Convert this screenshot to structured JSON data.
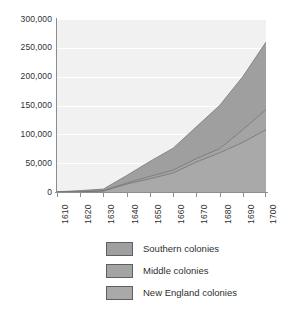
{
  "chart_data": {
    "type": "area",
    "stacked": true,
    "title": "",
    "subtitle": "",
    "xlabel": "",
    "ylabel": "",
    "grid": true,
    "legend_position": "bottom",
    "x": [
      1610,
      1620,
      1630,
      1640,
      1650,
      1660,
      1670,
      1680,
      1690,
      1700
    ],
    "xlim": [
      1610,
      1700
    ],
    "ylim": [
      0,
      300000
    ],
    "x_tick_labels": [
      "1610",
      "1620",
      "1630",
      "1640",
      "1650",
      "1660",
      "1670",
      "1680",
      "1690",
      "1700"
    ],
    "y_tick_labels": [
      "0",
      "50,000",
      "100,000",
      "150,000",
      "200,000",
      "250,000",
      "300,000"
    ],
    "y_ticks": [
      0,
      50000,
      100000,
      150000,
      200000,
      250000,
      300000
    ],
    "series": [
      {
        "name": "New England colonies",
        "color": "#a9a9a9",
        "values": [
          0,
          100,
          1800,
          13700,
          23000,
          33000,
          52000,
          68000,
          86000,
          108000
        ]
      },
      {
        "name": "Middle colonies",
        "color": "#a4a4a4",
        "values": [
          0,
          0,
          400,
          1900,
          4100,
          5000,
          6000,
          7000,
          22000,
          35000
        ]
      },
      {
        "name": "Southern colonies",
        "color": "#9f9f9f",
        "values": [
          400,
          2300,
          3000,
          13000,
          26000,
          38000,
          55000,
          75000,
          92000,
          117000
        ]
      }
    ],
    "stack_totals": [
      400,
      2400,
      5200,
      28600,
      53100,
      76000,
      113000,
      150000,
      200000,
      260000
    ],
    "annotations": []
  },
  "legend": {
    "items": [
      {
        "label": "Southern colonies",
        "swatch": "#9f9f9f"
      },
      {
        "label": "Middle colonies",
        "swatch": "#a4a4a4"
      },
      {
        "label": "New England colonies",
        "swatch": "#a9a9a9"
      }
    ]
  },
  "style": {
    "plot_background": "#f1f1f1",
    "gridline_color": "#ffffff",
    "axis_color": "#8d8d8d",
    "boundary_line_color": "#6e6e6e",
    "text_color": "#2f2f2f"
  }
}
